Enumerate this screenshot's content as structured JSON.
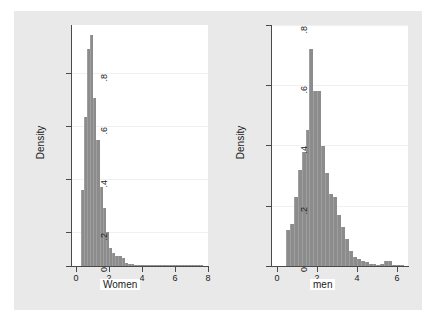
{
  "figure": {
    "background_color": "#e9e9e9",
    "plot_background_color": "#ffffff",
    "bar_color": "#8c8c8c",
    "axis_color": "#4a4a4a",
    "grid_color": "#f0f0f0"
  },
  "chart_data": [
    {
      "type": "bar",
      "panel": "left",
      "title": "",
      "xlabel": "Women",
      "ylabel": "Density",
      "xlim": [
        -0.35,
        8.3
      ],
      "ylim": [
        0,
        0.92
      ],
      "xticks": [
        0,
        2,
        4,
        6,
        8
      ],
      "xticklabels": [
        "0",
        "2",
        "4",
        "6",
        "8"
      ],
      "yticks": [
        0,
        0.2,
        0.4,
        0.6,
        0.8
      ],
      "yticklabels": [
        "0",
        ".2",
        ".4",
        ".6",
        ".8"
      ],
      "grid": true,
      "legend": "none",
      "bin_width": 0.2,
      "bin_starts": [
        0.2,
        0.4,
        0.6,
        0.8,
        1.0,
        1.2,
        1.4,
        1.6,
        1.8,
        2.0,
        2.2,
        2.4,
        2.6,
        2.8,
        3.0,
        3.2,
        3.4,
        3.6,
        3.8,
        4.0,
        4.2,
        4.4,
        4.6,
        4.8,
        5.0,
        5.2,
        5.4,
        5.6,
        5.8,
        6.0,
        6.2,
        6.4,
        6.6,
        6.8,
        7.0,
        7.2,
        7.4,
        7.6,
        7.8
      ],
      "values": [
        0.29,
        0.57,
        0.83,
        0.88,
        0.64,
        0.48,
        0.3,
        0.22,
        0.13,
        0.07,
        0.05,
        0.04,
        0.04,
        0.03,
        0.012,
        0.008,
        0.006,
        0.005,
        0.004,
        0.004,
        0.003,
        0.002,
        0.002,
        0.002,
        0.001,
        0.001,
        0.001,
        0.001,
        0.001,
        0.001,
        0.001,
        0.001,
        0.001,
        0.001,
        0.002,
        0.001,
        0.001,
        0.001,
        0.002
      ]
    },
    {
      "type": "bar",
      "panel": "right",
      "title": "",
      "xlabel": "men",
      "ylabel": "Density",
      "xlim": [
        -0.3,
        6.6
      ],
      "ylim": [
        0,
        0.8
      ],
      "xticks": [
        0,
        2,
        4,
        6
      ],
      "xticklabels": [
        "0",
        "2",
        "4",
        "6"
      ],
      "yticks": [
        0,
        0.2,
        0.4,
        0.6,
        0.8
      ],
      "yticklabels": [
        "0",
        ".2",
        ".4",
        ".6",
        ".8"
      ],
      "grid": true,
      "legend": "none",
      "bin_width": 0.2,
      "bin_starts": [
        0.4,
        0.6,
        0.8,
        1.0,
        1.2,
        1.4,
        1.6,
        1.8,
        2.0,
        2.2,
        2.4,
        2.6,
        2.8,
        3.0,
        3.2,
        3.4,
        3.6,
        3.8,
        4.0,
        4.2,
        4.4,
        4.6,
        4.8,
        5.0,
        5.2,
        5.4,
        5.6,
        5.8,
        6.0,
        6.2
      ],
      "values": [
        0.12,
        0.14,
        0.23,
        0.32,
        0.38,
        0.45,
        0.72,
        0.58,
        0.58,
        0.4,
        0.31,
        0.24,
        0.23,
        0.17,
        0.13,
        0.09,
        0.05,
        0.03,
        0.022,
        0.015,
        0.012,
        0.008,
        0.006,
        0.005,
        0.006,
        0.016,
        0.016,
        0.004,
        0.003,
        0.002
      ]
    }
  ]
}
